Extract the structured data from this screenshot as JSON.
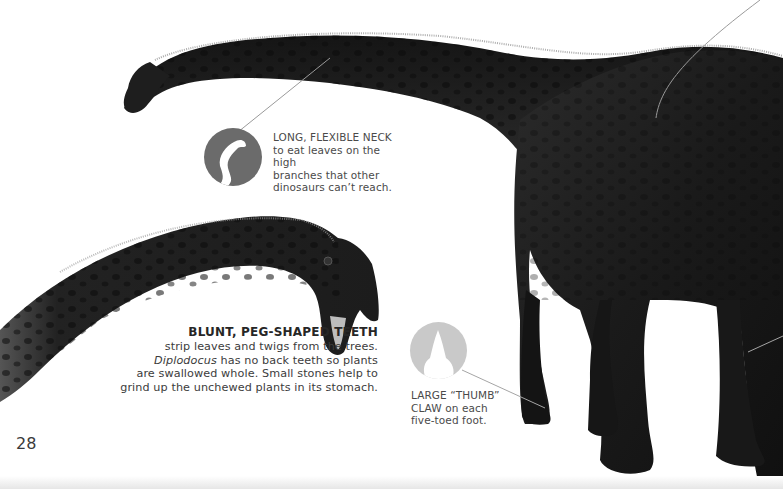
{
  "page": {
    "number": "28",
    "background": "#ffffff"
  },
  "callouts": {
    "neck": {
      "icon": "neck-silhouette-icon",
      "heading": "LONG, FLEXIBLE NECK",
      "lines": [
        "to eat leaves on the high",
        "branches that other",
        "dinosaurs can’t reach."
      ]
    },
    "teeth": {
      "heading": "BLUNT, PEG-SHAPED TEETH",
      "line1": "strip leaves and twigs from the trees.",
      "line2_italic": "Diplodocus",
      "line2_rest": " has no back teeth so plants",
      "line3": "are swallowed whole. Small stones help to",
      "line4": "grind up the unchewed plants in its stomach."
    },
    "claw": {
      "icon": "claw-icon",
      "heading": "LARGE “THUMB”",
      "lines": [
        "CLAW on each",
        "five-toed foot."
      ]
    }
  },
  "colors": {
    "dino_body": "#1c1c1c",
    "dino_highlight": "#3a3a3a",
    "badge_neck": "#6b6b6b",
    "badge_claw": "#c9c9c9",
    "leader_line": "#9a9a9a",
    "text": "#4a4a4a"
  }
}
